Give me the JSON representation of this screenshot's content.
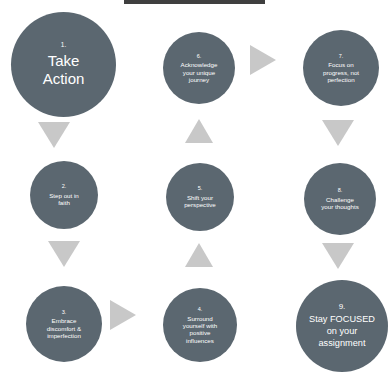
{
  "diagram": {
    "title_bar": "",
    "nodes": [
      {
        "id": "node-1",
        "num": "1.",
        "label": "Take\nAction",
        "size": "large",
        "x": 11,
        "y": 12,
        "d": 105
      },
      {
        "id": "node-2",
        "num": "2.",
        "label": "Step out in\nfaith",
        "size": "medium",
        "x": 30,
        "y": 161,
        "d": 68
      },
      {
        "id": "node-3",
        "num": "3.",
        "label": "Embrace\ndiscomfort &\nimperfection",
        "size": "medium",
        "x": 26,
        "y": 286,
        "d": 76
      },
      {
        "id": "node-4",
        "num": "4.",
        "label": "Surround\nyourself with\npositive\ninfluences",
        "size": "medium",
        "x": 163,
        "y": 288,
        "d": 74
      },
      {
        "id": "node-5",
        "num": "5.",
        "label": "Shift your\nperspective",
        "size": "medium",
        "x": 166,
        "y": 163,
        "d": 68
      },
      {
        "id": "node-6",
        "num": "6.",
        "label": "Acknowledge\nyour unique\njourney",
        "size": "medium",
        "x": 163,
        "y": 32,
        "d": 72
      },
      {
        "id": "node-7",
        "num": "7.",
        "label": "Focus on\nprogress, not\nperfection",
        "size": "medium",
        "x": 303,
        "y": 30,
        "d": 76
      },
      {
        "id": "node-8",
        "num": "8.",
        "label": "Challenge\nyour thoughts",
        "size": "medium",
        "x": 304,
        "y": 163,
        "d": 72
      },
      {
        "id": "node-9",
        "num": "9.",
        "label": "Stay FOCUSED\non your\nassignment",
        "size": "final",
        "x": 296,
        "y": 280,
        "d": 92
      }
    ],
    "arrows": [
      {
        "id": "arrow-1-to-2",
        "direction": "down",
        "x": 38,
        "y": 122
      },
      {
        "id": "arrow-2-to-3",
        "direction": "down",
        "x": 48,
        "y": 241
      },
      {
        "id": "arrow-3-to-4",
        "direction": "right",
        "x": 110,
        "y": 300
      },
      {
        "id": "arrow-4-to-5",
        "direction": "up",
        "x": 185,
        "y": 243
      },
      {
        "id": "arrow-5-to-6",
        "direction": "up",
        "x": 185,
        "y": 119
      },
      {
        "id": "arrow-6-to-7",
        "direction": "right",
        "x": 250,
        "y": 45
      },
      {
        "id": "arrow-7-to-8",
        "direction": "down",
        "x": 322,
        "y": 120
      },
      {
        "id": "arrow-8-to-9",
        "direction": "down",
        "x": 322,
        "y": 243
      }
    ],
    "colors": {
      "node_fill": "#5b6770",
      "node_text": "#ffffff",
      "arrow_fill": "#c8c8c8",
      "title_bar": "#3f3f3f",
      "background": "#ffffff"
    }
  }
}
